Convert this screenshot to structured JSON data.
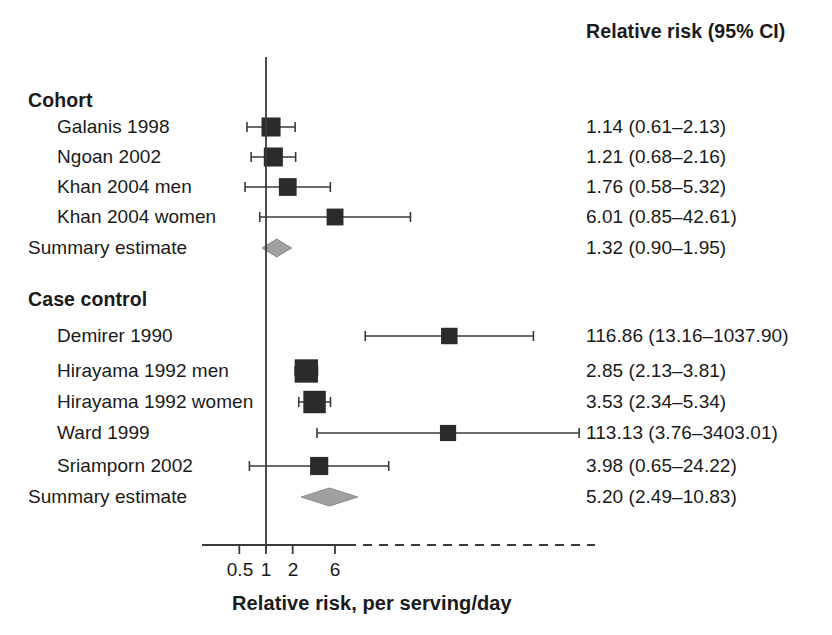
{
  "header": {
    "right_column_title": "Relative risk (95% CI)"
  },
  "axis": {
    "title": "Relative risk, per serving/day",
    "tick_labels": [
      "0.5",
      "1",
      "2",
      "6"
    ],
    "tick_values": [
      0.5,
      1,
      2,
      6
    ],
    "reference_value": 1
  },
  "groups": [
    {
      "label": "Cohort",
      "rows": [
        {
          "label": "Galanis 1998",
          "estimate_text": "1.14 (0.61–2.13)"
        },
        {
          "label": "Ngoan 2002",
          "estimate_text": "1.21 (0.68–2.16)"
        },
        {
          "label": "Khan 2004 men",
          "estimate_text": "1.76 (0.58–5.32)"
        },
        {
          "label": "Khan 2004 women",
          "estimate_text": "6.01 (0.85–42.61)"
        }
      ],
      "summary": {
        "label": "Summary estimate",
        "estimate_text": "1.32 (0.90–1.95)"
      }
    },
    {
      "label": "Case control",
      "rows": [
        {
          "label": "Demirer 1990",
          "estimate_text": "116.86 (13.16–1037.90)"
        },
        {
          "label": "Hirayama 1992 men",
          "estimate_text": "2.85 (2.13–3.81)"
        },
        {
          "label": "Hirayama 1992 women",
          "estimate_text": "3.53 (2.34–5.34)"
        },
        {
          "label": "Ward 1999",
          "estimate_text": "113.13 (3.76–3403.01)"
        },
        {
          "label": "Sriamporn 2002",
          "estimate_text": "3.98 (0.65–24.22)"
        }
      ],
      "summary": {
        "label": "Summary estimate",
        "estimate_text": "5.20 (2.49–10.83)"
      }
    }
  ],
  "colors": {
    "marker": "#2b2b2b",
    "line": "#3a3a3a",
    "diamond": "#a0a0a0",
    "diamond_edge": "#8a8a8a",
    "text": "#1a1a1a",
    "axis": "#3a3a3a"
  },
  "chart_data": {
    "type": "forest",
    "title": "",
    "xlabel": "Relative risk, per serving/day",
    "ylabel": "",
    "xscale": "log",
    "xticks": [
      0.5,
      1,
      2,
      6
    ],
    "xtick_labels": [
      "0.5",
      "1",
      "2",
      "6"
    ],
    "reference_line": 1,
    "legend": "none",
    "grid": false,
    "columns": [
      "Study",
      "Relative risk (95% CI)"
    ],
    "groups": [
      {
        "name": "Cohort",
        "studies": [
          {
            "label": "Galanis 1998",
            "rr": 1.14,
            "ci_low": 0.61,
            "ci_high": 2.13,
            "text": "1.14 (0.61–2.13)",
            "truncated_right": false,
            "weight": 0.62
          },
          {
            "label": "Ngoan 2002",
            "rr": 1.21,
            "ci_low": 0.68,
            "ci_high": 2.16,
            "text": "1.21 (0.68–2.16)",
            "truncated_right": false,
            "weight": 0.62
          },
          {
            "label": "Khan 2004 men",
            "rr": 1.76,
            "ci_low": 0.58,
            "ci_high": 5.32,
            "text": "1.76 (0.58–5.32)",
            "truncated_right": false,
            "weight": 0.52
          },
          {
            "label": "Khan 2004 women",
            "rr": 6.01,
            "ci_low": 0.85,
            "ci_high": 42.61,
            "text": "6.01 (0.85–42.61)",
            "truncated_right": true,
            "weight": 0.45
          }
        ],
        "summary": {
          "label": "Summary estimate",
          "rr": 1.32,
          "ci_low": 0.9,
          "ci_high": 1.95,
          "text": "1.32 (0.90–1.95)"
        }
      },
      {
        "name": "Case control",
        "studies": [
          {
            "label": "Demirer 1990",
            "rr": 116.86,
            "ci_low": 13.16,
            "ci_high": 1037.9,
            "text": "116.86 (13.16–1037.90)",
            "truncated_right": true,
            "weight": 0.42
          },
          {
            "label": "Hirayama 1992 men",
            "rr": 2.85,
            "ci_low": 2.13,
            "ci_high": 3.81,
            "text": "2.85 (2.13–3.81)",
            "truncated_right": false,
            "weight": 0.95
          },
          {
            "label": "Hirayama 1992 women",
            "rr": 3.53,
            "ci_low": 2.34,
            "ci_high": 5.34,
            "text": "3.53 (2.34–5.34)",
            "truncated_right": false,
            "weight": 0.88
          },
          {
            "label": "Ward 1999",
            "rr": 113.13,
            "ci_low": 3.76,
            "ci_high": 3403.01,
            "text": "113.13 (3.76–3403.01)",
            "truncated_right": true,
            "weight": 0.4
          },
          {
            "label": "Sriamporn 2002",
            "rr": 3.98,
            "ci_low": 0.65,
            "ci_high": 24.22,
            "text": "3.98 (0.65–24.22)",
            "truncated_right": false,
            "weight": 0.55
          }
        ],
        "summary": {
          "label": "Summary estimate",
          "rr": 5.2,
          "ci_low": 2.49,
          "ci_high": 10.83,
          "text": "5.20 (2.49–10.83)"
        }
      }
    ]
  }
}
